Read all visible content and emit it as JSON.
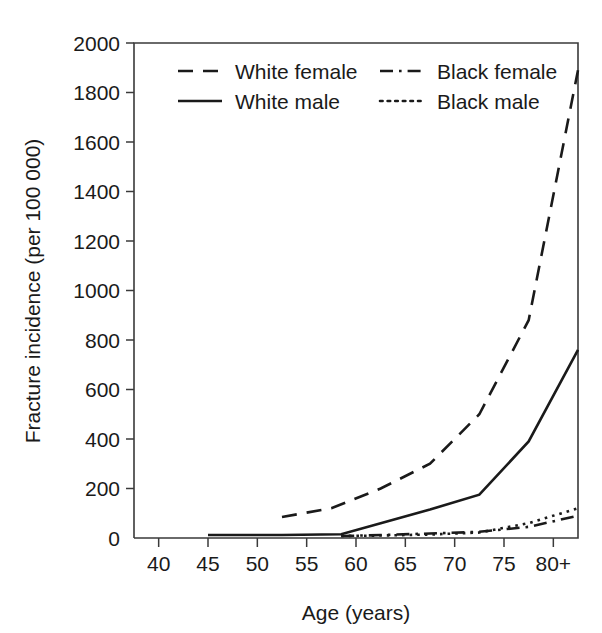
{
  "chart_data": {
    "type": "line",
    "title": "",
    "xlabel": "Age (years)",
    "ylabel": "Fracture incidence (per 100 000)",
    "xlim": [
      37.5,
      82.5
    ],
    "ylim": [
      0,
      2000
    ],
    "grid": false,
    "legend_position": "top-center",
    "x_tick_labels": [
      "40",
      "45",
      "50",
      "55",
      "60",
      "65",
      "70",
      "75",
      "80+"
    ],
    "x_tick_values": [
      40,
      45,
      50,
      55,
      60,
      65,
      70,
      75,
      80
    ],
    "y_tick_labels": [
      "0",
      "200",
      "400",
      "600",
      "800",
      "1000",
      "1200",
      "1400",
      "1600",
      "1800",
      "2000"
    ],
    "y_tick_values": [
      0,
      200,
      400,
      600,
      800,
      1000,
      1200,
      1400,
      1600,
      1800,
      2000
    ],
    "series": [
      {
        "name": "White female",
        "style": "dashed",
        "x": [
          52.5,
          57.5,
          62.5,
          67.5,
          72.5,
          77.5,
          82.5
        ],
        "values": [
          85,
          120,
          200,
          300,
          500,
          880,
          1890
        ]
      },
      {
        "name": "White male",
        "style": "solid",
        "x": [
          45,
          52.5,
          58.5,
          62.5,
          67.5,
          72.5,
          77.5,
          82.5
        ],
        "values": [
          12,
          12,
          15,
          60,
          115,
          175,
          390,
          760
        ]
      },
      {
        "name": "Black female",
        "style": "dashdot",
        "x": [
          58.5,
          62.5,
          67.5,
          72.5,
          77.5,
          82.5
        ],
        "values": [
          8,
          12,
          18,
          25,
          45,
          90
        ]
      },
      {
        "name": "Black male",
        "style": "dotted",
        "x": [
          58.5,
          62.5,
          67.5,
          72.5,
          77.5,
          82.5
        ],
        "values": [
          8,
          10,
          14,
          22,
          60,
          120
        ]
      }
    ]
  },
  "legend": {
    "entries": [
      {
        "label": "White female",
        "style": "dashed"
      },
      {
        "label": "Black female",
        "style": "dashdot"
      },
      {
        "label": "White male",
        "style": "solid"
      },
      {
        "label": "Black male",
        "style": "dotted"
      }
    ]
  },
  "colors": {
    "line": "#1a1a1a",
    "axis": "#3a3a3a",
    "background": "#ffffff"
  }
}
